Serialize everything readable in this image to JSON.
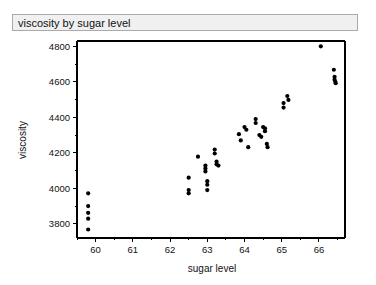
{
  "window": {
    "title": "viscosity by sugar level"
  },
  "chart_data": {
    "type": "scatter",
    "title": "viscosity by sugar level",
    "xlabel": "sugar level",
    "ylabel": "viscosity",
    "xlim": [
      59.5,
      66.7
    ],
    "ylim": [
      3720,
      4830
    ],
    "xticks": [
      60,
      61,
      62,
      63,
      64,
      65,
      66
    ],
    "xtick_labels": [
      "60",
      "61",
      "62",
      "63",
      "64",
      "65",
      "66"
    ],
    "yticks": [
      3800,
      4000,
      4200,
      4400,
      4600,
      4800
    ],
    "ytick_labels": [
      "3800",
      "4000",
      "4200",
      "4400",
      "4600",
      "4800"
    ],
    "grid": false,
    "legend": false,
    "marker": "filled-circle",
    "marker_color": "#000000",
    "n_points": 44,
    "series": [
      {
        "name": "viscosity",
        "points": [
          [
            59.8,
            3972
          ],
          [
            59.8,
            3900
          ],
          [
            59.8,
            3862
          ],
          [
            59.8,
            3829
          ],
          [
            59.8,
            3768
          ],
          [
            62.5,
            4060
          ],
          [
            62.5,
            3990
          ],
          [
            62.5,
            3972
          ],
          [
            62.75,
            4178
          ],
          [
            62.95,
            4128
          ],
          [
            62.95,
            4112
          ],
          [
            62.95,
            4095
          ],
          [
            63.0,
            4040
          ],
          [
            63.0,
            4020
          ],
          [
            63.0,
            3990
          ],
          [
            63.2,
            4218
          ],
          [
            63.2,
            4196
          ],
          [
            63.25,
            4150
          ],
          [
            63.25,
            4135
          ],
          [
            63.3,
            4128
          ],
          [
            63.85,
            4305
          ],
          [
            63.9,
            4270
          ],
          [
            64.0,
            4345
          ],
          [
            64.05,
            4330
          ],
          [
            64.1,
            4232
          ],
          [
            64.3,
            4390
          ],
          [
            64.3,
            4368
          ],
          [
            64.4,
            4300
          ],
          [
            64.45,
            4290
          ],
          [
            64.5,
            4345
          ],
          [
            64.55,
            4338
          ],
          [
            64.55,
            4322
          ],
          [
            64.6,
            4250
          ],
          [
            64.62,
            4232
          ],
          [
            65.05,
            4480
          ],
          [
            65.05,
            4455
          ],
          [
            65.15,
            4520
          ],
          [
            65.18,
            4498
          ],
          [
            66.05,
            4800
          ],
          [
            66.4,
            4668
          ],
          [
            66.42,
            4628
          ],
          [
            66.42,
            4612
          ],
          [
            66.44,
            4600
          ],
          [
            66.45,
            4592
          ]
        ]
      }
    ]
  }
}
